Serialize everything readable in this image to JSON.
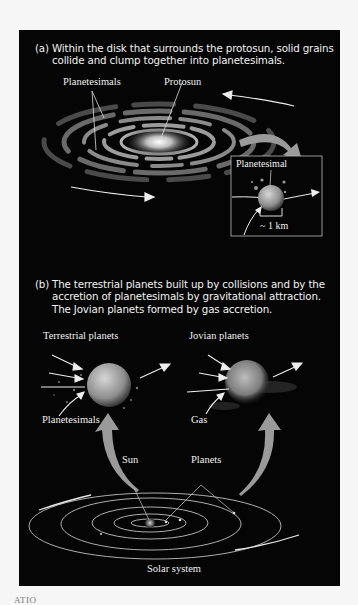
{
  "figure": {
    "part_a": {
      "label": "(a)",
      "caption": "Within the disk that surrounds the protosun, solid grains collide and clump together into planetesimals.",
      "labels": {
        "planetesimals": "Planetesimals",
        "protosun": "Protosun",
        "inset_planetesimal": "Planetesimal",
        "scale": "~ 1 km"
      }
    },
    "part_b": {
      "label": "(b)",
      "caption": "The terrestrial planets built up by collisions and by the accretion of planetesimals by gravitational attraction. The Jovian planets formed by gas accretion.",
      "labels": {
        "terrestrial_planets": "Terrestrial planets",
        "jovian_planets": "Jovian planets",
        "planetesimals": "Planetesimals",
        "gas": "Gas",
        "sun": "Sun",
        "planets": "Planets",
        "solar_system": "Solar system"
      }
    }
  },
  "footer_fragment": "ATIO"
}
